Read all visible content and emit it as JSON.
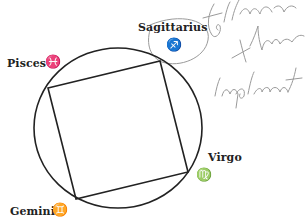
{
  "diagram": {
    "circle": {
      "cx": 118,
      "cy": 128,
      "rx": 84,
      "ry": 80,
      "stroke": "#222222"
    },
    "square": {
      "points": [
        [
          48,
          88
        ],
        [
          160,
          61
        ],
        [
          188,
          172
        ],
        [
          76,
          199
        ]
      ],
      "stroke": "#222222"
    },
    "labels": [
      {
        "id": "sagittarius",
        "text": "Sagittarius",
        "glyph": "♐",
        "x": 138,
        "y": 21,
        "gx": 169,
        "gy": 40
      },
      {
        "id": "pisces",
        "text": "Pisces",
        "glyph": "♓",
        "x": 7,
        "y": 57,
        "gx": 45,
        "gy": 56
      },
      {
        "id": "virgo",
        "text": "Virgo",
        "glyph": "♍",
        "x": 208,
        "y": 152,
        "gx": 197,
        "gy": 170
      },
      {
        "id": "gemini",
        "text": "Gemini",
        "glyph": "♊",
        "x": 10,
        "y": 205,
        "gx": 52,
        "gy": 205
      }
    ],
    "annotations": {
      "handwriting": [
        "follow",
        "through",
        "implement"
      ],
      "color": "#9a9a9a"
    }
  }
}
